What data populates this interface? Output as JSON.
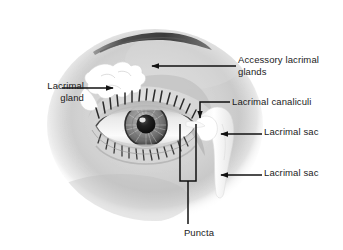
{
  "figure": {
    "width": 343,
    "height": 250,
    "background_color": "#ffffff",
    "face_tone_color": "#c9c9c9",
    "structure_color": "#ffffff",
    "leader_color": "#111111",
    "text_color": "#1b1b1b"
  },
  "labels": {
    "lacrimal_gland": "Lacrimal\ngland",
    "accessory_glands": "Accessory lacrimal\nglands",
    "canaliculi": "Lacrimal canaliculi",
    "sac_upper": "Lacrimal sac",
    "sac_lower": "Lacrimal sac",
    "puncta": "Puncta"
  },
  "anatomy_parts": [
    {
      "name": "lacrimal-gland",
      "label": "Lacrimal gland",
      "leader": "arrow-right",
      "side": "left"
    },
    {
      "name": "accessory-lacrimal-glands",
      "label": "Accessory lacrimal glands",
      "leader": "arrow-left",
      "side": "right"
    },
    {
      "name": "lacrimal-canaliculi",
      "label": "Lacrimal canaliculi",
      "leader": "elbow-arrow-down",
      "side": "right"
    },
    {
      "name": "lacrimal-sac-upper",
      "label": "Lacrimal sac",
      "leader": "arrow-left",
      "side": "right"
    },
    {
      "name": "lacrimal-sac-lower",
      "label": "Lacrimal sac",
      "leader": "arrow-left",
      "side": "right"
    },
    {
      "name": "puncta",
      "label": "Puncta",
      "leader": "bracket-down",
      "side": "bottom"
    }
  ],
  "icons": {
    "eyebrow": "eyebrow-shape",
    "iris": "iris-shape",
    "pupil": "pupil-shape",
    "eyelashes": "eyelash-marks"
  }
}
